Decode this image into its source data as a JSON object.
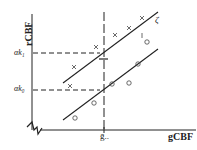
{
  "diagram": {
    "y_axis_label": "rCBF",
    "x_axis_label": "gCBF",
    "y_markers": [
      {
        "label": "αk₁"
      },
      {
        "label": "αk₀"
      }
    ],
    "x_marker": {
      "label": "ḡ.."
    },
    "line_label": "ζ",
    "series": [
      {
        "name": "upper",
        "marker": "x"
      },
      {
        "name": "lower",
        "marker": "o"
      }
    ],
    "colors": {
      "ink": "#222222",
      "background": "#ffffff"
    }
  }
}
